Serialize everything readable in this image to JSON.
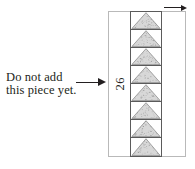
{
  "diagram": {
    "type": "sewing-pattern-assembly-diagram",
    "annotation": {
      "line1": "Do not add",
      "line2": "this piece yet."
    },
    "leader_arrow": {
      "icon": "right-arrow-icon",
      "direction": "right",
      "points_to": "left-blank-strip"
    },
    "top_direction_arrow": {
      "icon": "right-arrow-icon",
      "direction": "right"
    },
    "outer_block": {
      "border_color": "#b9b9b9"
    },
    "left_strip": {
      "label": "26",
      "label_rotation_deg": 180,
      "fill": "#ffffff"
    },
    "triangle_column": {
      "count": 8,
      "fill": "#d8d8d8",
      "stroke": "#5b5b5b",
      "orientation": "apex-up",
      "texture": "speckled-gray"
    },
    "right_strip": {
      "fill": "#ffffff"
    },
    "colors": {
      "ink": "#231f20",
      "outer_border": "#b9b9b9",
      "piece_stroke": "#5b5b5b",
      "piece_fill": "#d8d8d8",
      "background": "#ffffff"
    }
  }
}
